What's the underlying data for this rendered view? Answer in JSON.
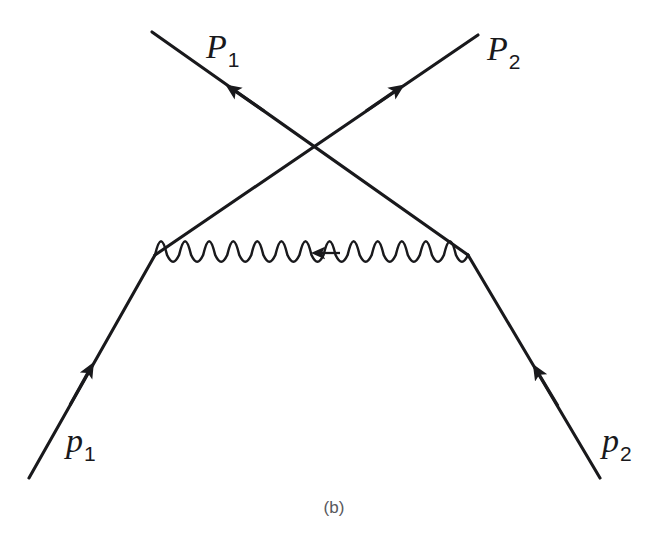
{
  "figure": {
    "caption": "(b)",
    "type": "feynman-diagram",
    "background_color": "#ffffff",
    "line_color": "#19191c",
    "caption_color": "#58585c",
    "width": 668,
    "height": 546
  },
  "labels": {
    "outgoing_left": {
      "base": "P",
      "sub": "1"
    },
    "outgoing_right": {
      "base": "P",
      "sub": "2"
    },
    "incoming_left": {
      "base": "p",
      "sub": "1"
    },
    "incoming_right": {
      "base": "p",
      "sub": "2"
    }
  },
  "diagram": {
    "vertices": [
      {
        "name": "vertex-left",
        "x": 155,
        "y": 255
      },
      {
        "name": "vertex-right",
        "x": 468,
        "y": 255
      }
    ],
    "crossing_point": {
      "x": 315,
      "y": 152
    },
    "fermion_lines": [
      {
        "name": "incoming-left-to-vertex-left",
        "label": "p1",
        "from": {
          "x": 29,
          "y": 478
        },
        "to": {
          "x": 155,
          "y": 255
        },
        "arrow_direction": "toward-vertex",
        "arrow_at": {
          "x": 84,
          "y": 380
        }
      },
      {
        "name": "vertex-left-to-outgoing-right",
        "label": "P2",
        "from": {
          "x": 155,
          "y": 255
        },
        "to": {
          "x": 478,
          "y": 35
        },
        "arrow_direction": "outgoing-up-right",
        "arrow_at": {
          "x": 387,
          "y": 97
        }
      },
      {
        "name": "incoming-right-to-vertex-right",
        "label": "p2",
        "from": {
          "x": 600,
          "y": 478
        },
        "to": {
          "x": 468,
          "y": 255
        },
        "arrow_direction": "toward-vertex",
        "arrow_at": {
          "x": 543,
          "y": 381
        }
      },
      {
        "name": "vertex-right-to-outgoing-left",
        "label": "P1",
        "from": {
          "x": 468,
          "y": 255
        },
        "to": {
          "x": 152,
          "y": 32
        },
        "arrow_direction": "outgoing-up-left",
        "arrow_at": {
          "x": 243,
          "y": 97
        }
      }
    ],
    "photon_line": {
      "name": "exchanged-photon",
      "from": {
        "x": 155,
        "y": 255
      },
      "to": {
        "x": 468,
        "y": 255
      },
      "cycles": 13,
      "amplitude": 10,
      "arrow_direction": "leftward",
      "arrow_at": {
        "x": 322,
        "y": 253
      }
    }
  }
}
